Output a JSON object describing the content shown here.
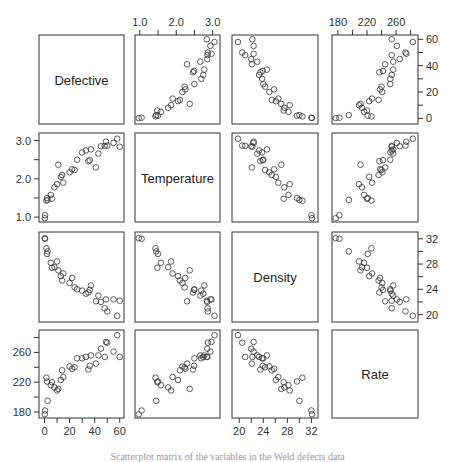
{
  "chart_data": {
    "type": "scatter",
    "subtype": "scatterplot-matrix",
    "title": "",
    "variables": [
      "Defective",
      "Temperature",
      "Density",
      "Rate"
    ],
    "ranges": {
      "Defective": [
        -2,
        61
      ],
      "Temperature": [
        0.95,
        3.12
      ],
      "Density": [
        19.3,
        32.6
      ],
      "Rate": [
        176,
        286
      ]
    },
    "axes": {
      "top": [
        {
          "column": 1,
          "variable": "Temperature",
          "ticks": [
            1.0,
            1.5,
            2.0,
            2.5,
            3.0
          ],
          "labels": [
            "1.0",
            "2.0",
            "3.0"
          ]
        },
        {
          "column": 3,
          "variable": "Rate",
          "ticks": [
            180,
            200,
            220,
            240,
            260,
            280
          ],
          "labels": [
            "180",
            "220",
            "260"
          ]
        }
      ],
      "right": [
        {
          "row": 0,
          "variable": "Defective",
          "ticks": [
            0,
            10,
            20,
            30,
            40,
            50,
            60
          ],
          "labels": [
            "0",
            "20",
            "40",
            "60"
          ]
        },
        {
          "row": 2,
          "variable": "Density",
          "ticks": [
            20,
            22,
            24,
            26,
            28,
            30,
            32
          ],
          "labels": [
            "20",
            "24",
            "28",
            "32"
          ]
        }
      ],
      "left": [
        {
          "row": 1,
          "variable": "Temperature",
          "ticks": [
            1.0,
            1.5,
            2.0,
            2.5,
            3.0
          ],
          "labels": [
            "1.0",
            "2.0",
            "3.0"
          ]
        },
        {
          "row": 3,
          "variable": "Rate",
          "ticks": [
            180,
            200,
            220,
            240,
            260,
            280
          ],
          "labels": [
            "180",
            "220",
            "260"
          ]
        }
      ],
      "bottom": [
        {
          "column": 0,
          "variable": "Defective",
          "ticks": [
            0,
            10,
            20,
            30,
            40,
            50,
            60
          ],
          "labels": [
            "0",
            "20",
            "40",
            "60"
          ]
        },
        {
          "column": 2,
          "variable": "Density",
          "ticks": [
            20,
            22,
            24,
            26,
            28,
            30,
            32
          ],
          "labels": [
            "20",
            "24",
            "28",
            "32"
          ]
        }
      ]
    },
    "observations": [
      {
        "Defective": 0.2,
        "Temperature": 0.97,
        "Density": 32.1,
        "Rate": 177
      },
      {
        "Defective": 0.5,
        "Temperature": 1.05,
        "Density": 32.0,
        "Rate": 182
      },
      {
        "Defective": 1.5,
        "Temperature": 1.43,
        "Density": 30.5,
        "Rate": 226
      },
      {
        "Defective": 2.0,
        "Temperature": 1.5,
        "Density": 29.6,
        "Rate": 221
      },
      {
        "Defective": 2.5,
        "Temperature": 1.45,
        "Density": 30.0,
        "Rate": 195
      },
      {
        "Defective": 5.0,
        "Temperature": 1.58,
        "Density": 28.2,
        "Rate": 216
      },
      {
        "Defective": 6.0,
        "Temperature": 1.48,
        "Density": 27.4,
        "Rate": 220
      },
      {
        "Defective": 8.0,
        "Temperature": 1.78,
        "Density": 27.5,
        "Rate": 213
      },
      {
        "Defective": 10.0,
        "Temperature": 1.86,
        "Density": 28.4,
        "Rate": 209
      },
      {
        "Defective": 11.0,
        "Temperature": 2.37,
        "Density": 27.0,
        "Rate": 211
      },
      {
        "Defective": 13.0,
        "Temperature": 2.05,
        "Density": 26.1,
        "Rate": 223
      },
      {
        "Defective": 14.0,
        "Temperature": 2.1,
        "Density": 25.4,
        "Rate": 236
      },
      {
        "Defective": 15.0,
        "Temperature": 1.9,
        "Density": 26.5,
        "Rate": 227
      },
      {
        "Defective": 20.0,
        "Temperature": 2.17,
        "Density": 25.0,
        "Rate": 241
      },
      {
        "Defective": 22.0,
        "Temperature": 2.25,
        "Density": 25.8,
        "Rate": 238
      },
      {
        "Defective": 24.0,
        "Temperature": 2.23,
        "Density": 24.3,
        "Rate": 240
      },
      {
        "Defective": 26.0,
        "Temperature": 2.5,
        "Density": 24.0,
        "Rate": 252
      },
      {
        "Defective": 30.0,
        "Temperature": 2.69,
        "Density": 23.8,
        "Rate": 252
      },
      {
        "Defective": 33.0,
        "Temperature": 2.74,
        "Density": 23.3,
        "Rate": 254
      },
      {
        "Defective": 35.0,
        "Temperature": 2.46,
        "Density": 23.5,
        "Rate": 237
      },
      {
        "Defective": 36.0,
        "Temperature": 2.49,
        "Density": 23.9,
        "Rate": 242
      },
      {
        "Defective": 37.0,
        "Temperature": 2.77,
        "Density": 24.6,
        "Rate": 256
      },
      {
        "Defective": 41.0,
        "Temperature": 2.3,
        "Density": 22.1,
        "Rate": 245
      },
      {
        "Defective": 43.0,
        "Temperature": 2.66,
        "Density": 23.0,
        "Rate": 256
      },
      {
        "Defective": 45.0,
        "Temperature": 2.85,
        "Density": 22.0,
        "Rate": 265
      },
      {
        "Defective": 48.0,
        "Temperature": 2.86,
        "Density": 21.0,
        "Rate": 254
      },
      {
        "Defective": 49.0,
        "Temperature": 2.97,
        "Density": 22.4,
        "Rate": 274
      },
      {
        "Defective": 50.0,
        "Temperature": 2.87,
        "Density": 20.5,
        "Rate": 273
      },
      {
        "Defective": 55.0,
        "Temperature": 2.94,
        "Density": 22.4,
        "Rate": 261
      },
      {
        "Defective": 58.0,
        "Temperature": 3.05,
        "Density": 19.8,
        "Rate": 283
      },
      {
        "Defective": 60.0,
        "Temperature": 2.84,
        "Density": 22.2,
        "Rate": 254
      }
    ],
    "grid": false,
    "legend": null,
    "marker": "open-circle"
  },
  "caption": "Scatterplot matrix of the variables in the Weld defects data"
}
